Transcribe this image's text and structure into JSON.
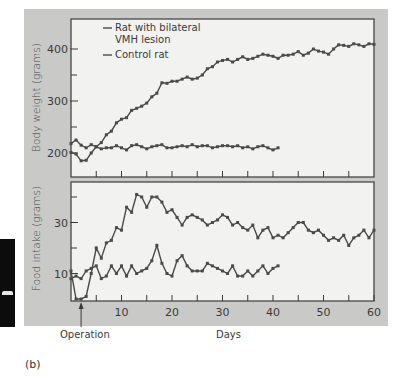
{
  "figure": {
    "panel_label": "(b)",
    "annotation": "Operation",
    "annotation_day": 2,
    "colors": {
      "background": "#c9c9c7",
      "plot_bg": "#f2f2f0",
      "line": "#4a4a4a",
      "axis": "#3a3a3a"
    }
  },
  "chart_data": [
    {
      "type": "line",
      "title": "",
      "xlabel": "",
      "ylabel": "Body weight (grams)",
      "xlim": [
        0,
        60
      ],
      "ylim": [
        155,
        450
      ],
      "yticks": [
        200,
        300,
        400
      ],
      "ytick_minor": [
        250,
        350
      ],
      "xticks": [
        5,
        10,
        15,
        20,
        25,
        30,
        35,
        40,
        45,
        50,
        55
      ],
      "grid": false,
      "legend": [
        "Rat with bilateral VMH lesion",
        "Control rat"
      ],
      "legend_position": "upper left",
      "series": [
        {
          "name": "Rat with bilateral VMH lesion",
          "x": [
            0,
            1,
            2,
            3,
            4,
            5,
            6,
            7,
            8,
            9,
            10,
            11,
            12,
            13,
            14,
            15,
            16,
            17,
            18,
            19,
            20,
            21,
            22,
            23,
            24,
            25,
            26,
            27,
            28,
            29,
            30,
            31,
            32,
            33,
            34,
            35,
            36,
            37,
            38,
            39,
            40,
            41,
            42,
            43,
            44,
            45,
            46,
            47,
            48,
            49,
            50,
            51,
            52,
            53,
            54,
            55,
            56,
            57,
            58,
            59,
            60
          ],
          "values": [
            201,
            198,
            185,
            186,
            200,
            212,
            220,
            235,
            242,
            258,
            265,
            268,
            282,
            286,
            290,
            296,
            308,
            315,
            335,
            334,
            338,
            338,
            342,
            346,
            342,
            344,
            350,
            362,
            366,
            375,
            378,
            380,
            375,
            380,
            385,
            380,
            382,
            386,
            390,
            388,
            386,
            382,
            388,
            388,
            390,
            395,
            388,
            392,
            400,
            396,
            394,
            390,
            400,
            408,
            407,
            405,
            410,
            408,
            405,
            410,
            409
          ]
        },
        {
          "name": "Control rat",
          "x": [
            0,
            1,
            2,
            3,
            4,
            5,
            6,
            7,
            8,
            9,
            10,
            11,
            12,
            13,
            14,
            15,
            16,
            17,
            18,
            19,
            20,
            21,
            22,
            23,
            24,
            25,
            26,
            27,
            28,
            29,
            30,
            31,
            32,
            33,
            34,
            35,
            36,
            37,
            38,
            39,
            40,
            41
          ],
          "values": [
            218,
            225,
            215,
            210,
            216,
            212,
            208,
            210,
            210,
            214,
            210,
            206,
            214,
            216,
            212,
            208,
            212,
            214,
            216,
            210,
            210,
            212,
            214,
            212,
            216,
            212,
            214,
            214,
            210,
            212,
            214,
            214,
            212,
            214,
            210,
            212,
            208,
            212,
            214,
            210,
            206,
            210
          ]
        }
      ]
    },
    {
      "type": "line",
      "title": "",
      "xlabel": "Days",
      "ylabel": "Food intake (grams)",
      "xlim": [
        0,
        60
      ],
      "ylim": [
        0,
        42
      ],
      "xticks": [
        10,
        20,
        30,
        40,
        50,
        60
      ],
      "xtick_minor": [
        5,
        15,
        25,
        35,
        45,
        55
      ],
      "yticks": [
        10,
        30
      ],
      "ytick_minor": [
        20,
        40
      ],
      "grid": false,
      "series": [
        {
          "name": "Rat with bilateral VMH lesion",
          "x": [
            0,
            1,
            2,
            3,
            4,
            5,
            6,
            7,
            8,
            9,
            10,
            11,
            12,
            13,
            14,
            15,
            16,
            17,
            18,
            19,
            20,
            21,
            22,
            23,
            24,
            25,
            26,
            27,
            28,
            29,
            30,
            31,
            32,
            33,
            34,
            35,
            36,
            37,
            38,
            39,
            40,
            41,
            42,
            43,
            44,
            45,
            46,
            47,
            48,
            49,
            50,
            51,
            52,
            53,
            54,
            55,
            56,
            57,
            58,
            59,
            60
          ],
          "values": [
            11,
            0,
            0,
            1,
            10,
            20,
            16,
            22,
            23,
            28,
            27,
            36,
            34,
            41,
            40,
            36,
            40,
            40,
            38,
            34,
            35,
            32,
            29,
            32,
            33,
            32,
            31,
            29,
            30,
            31,
            33,
            32,
            29,
            30,
            28,
            27,
            29,
            24,
            27,
            28,
            24,
            25,
            24,
            26,
            28,
            30,
            30,
            27,
            26,
            27,
            25,
            23,
            24,
            23,
            25,
            21,
            24,
            25,
            27,
            24,
            27
          ]
        },
        {
          "name": "Control rat",
          "x": [
            0,
            1,
            2,
            3,
            4,
            5,
            6,
            7,
            8,
            9,
            10,
            11,
            12,
            13,
            14,
            15,
            16,
            17,
            18,
            19,
            20,
            21,
            22,
            23,
            24,
            25,
            26,
            27,
            28,
            29,
            30,
            31,
            32,
            33,
            34,
            35,
            36,
            37,
            38,
            39,
            40,
            41
          ],
          "values": [
            8,
            9,
            8,
            11,
            12,
            13,
            8,
            9,
            13,
            10,
            13,
            9,
            13,
            10,
            11,
            12,
            15,
            21,
            14,
            10,
            9,
            15,
            17,
            13,
            11,
            11,
            11,
            14,
            13,
            12,
            11,
            10,
            13,
            9,
            9,
            11,
            9,
            11,
            13,
            10,
            12,
            13
          ]
        }
      ]
    }
  ]
}
